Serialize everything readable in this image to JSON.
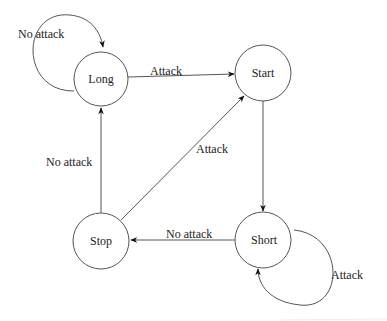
{
  "diagram": {
    "type": "state-transition",
    "states": {
      "long": {
        "label": "Long"
      },
      "start": {
        "label": "Start"
      },
      "stop": {
        "label": "Stop"
      },
      "short": {
        "label": "Short"
      }
    },
    "transitions": {
      "long_self": {
        "from": "Long",
        "to": "Long",
        "label": "No attack"
      },
      "long_to_start": {
        "from": "Long",
        "to": "Start",
        "label": "Attack"
      },
      "stop_to_long": {
        "from": "Stop",
        "to": "Long",
        "label": "No attack"
      },
      "stop_to_start": {
        "from": "Stop",
        "to": "Start",
        "label": "Attack"
      },
      "start_to_short": {
        "from": "Start",
        "to": "Short",
        "label": ""
      },
      "short_to_stop": {
        "from": "Short",
        "to": "Stop",
        "label": "No attack"
      },
      "short_self": {
        "from": "Short",
        "to": "Short",
        "label": "Attack"
      }
    },
    "colors": {
      "stroke": "#555555",
      "arrowhead": "#111111",
      "text": "#222222",
      "background": "#ffffff"
    }
  }
}
